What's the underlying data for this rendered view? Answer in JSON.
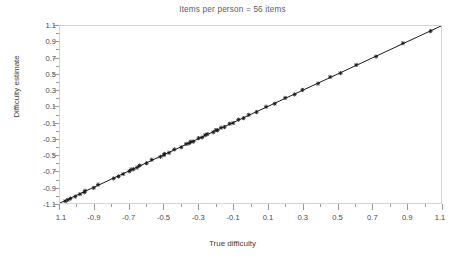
{
  "chart_data": {
    "type": "scatter",
    "title": "Items per person = 56 items",
    "xlabel": "True difficulty",
    "ylabel": "Difficulty estimate",
    "xlim": [
      -1.1,
      1.1
    ],
    "ylim": [
      -1.1,
      1.1
    ],
    "grid": false,
    "legend": null,
    "x_tick_labels": [
      "1.1",
      "-0.9",
      "-0.7",
      "-0.5",
      "-0.3",
      "-0.1",
      "0.1",
      "0.3",
      "0.5",
      "0.7",
      "0.9",
      "1.1"
    ],
    "x_tick_values": [
      -1.1,
      -0.9,
      -0.7,
      -0.5,
      -0.3,
      -0.1,
      0.1,
      0.3,
      0.5,
      0.7,
      0.9,
      1.1
    ],
    "y_tick_labels": [
      "1.1",
      "0.9",
      "0.7",
      "0.5",
      "0.3",
      "0.1",
      "-0.1",
      "-0.3",
      "-0.5",
      "-0.7",
      "-0.9",
      "-1.1"
    ],
    "y_tick_values": [
      1.1,
      0.9,
      0.7,
      0.5,
      0.3,
      0.1,
      -0.1,
      -0.3,
      -0.5,
      -0.7,
      -0.9,
      -1.1
    ],
    "minor_tick_step": 0.1,
    "marker": "plus-cross",
    "marker_color": "#1a1a1a",
    "reference_line": {
      "type": "identity",
      "from": [
        -1.1,
        -1.1
      ],
      "to": [
        1.1,
        1.1
      ],
      "color": "#1a1a1a"
    },
    "series": [
      {
        "name": "items",
        "x": [
          -1.07,
          -1.055,
          -1.04,
          -1.012,
          -0.985,
          -0.96,
          -0.955,
          -0.905,
          -0.88,
          -0.79,
          -0.762,
          -0.735,
          -0.7,
          -0.69,
          -0.676,
          -0.655,
          -0.64,
          -0.6,
          -0.57,
          -0.52,
          -0.5,
          -0.497,
          -0.47,
          -0.44,
          -0.4,
          -0.372,
          -0.355,
          -0.345,
          -0.33,
          -0.3,
          -0.28,
          -0.262,
          -0.25,
          -0.215,
          -0.2,
          -0.19,
          -0.17,
          -0.15,
          -0.12,
          -0.1,
          -0.07,
          -0.04,
          -0.01,
          0.035,
          0.09,
          0.14,
          0.2,
          0.255,
          0.3,
          0.39,
          0.46,
          0.52,
          0.61,
          0.725,
          0.88,
          1.04
        ],
        "y": [
          -1.078,
          -1.062,
          -1.045,
          -1.02,
          -0.99,
          -0.968,
          -0.948,
          -0.912,
          -0.872,
          -0.795,
          -0.77,
          -0.74,
          -0.706,
          -0.684,
          -0.68,
          -0.66,
          -0.634,
          -0.606,
          -0.562,
          -0.526,
          -0.505,
          -0.49,
          -0.476,
          -0.434,
          -0.408,
          -0.366,
          -0.36,
          -0.338,
          -0.336,
          -0.294,
          -0.286,
          -0.256,
          -0.244,
          -0.22,
          -0.194,
          -0.196,
          -0.164,
          -0.156,
          -0.114,
          -0.106,
          -0.064,
          -0.046,
          -0.004,
          0.03,
          0.096,
          0.134,
          0.206,
          0.25,
          0.306,
          0.384,
          0.466,
          0.514,
          0.616,
          0.72,
          0.886,
          1.036
        ]
      }
    ]
  }
}
